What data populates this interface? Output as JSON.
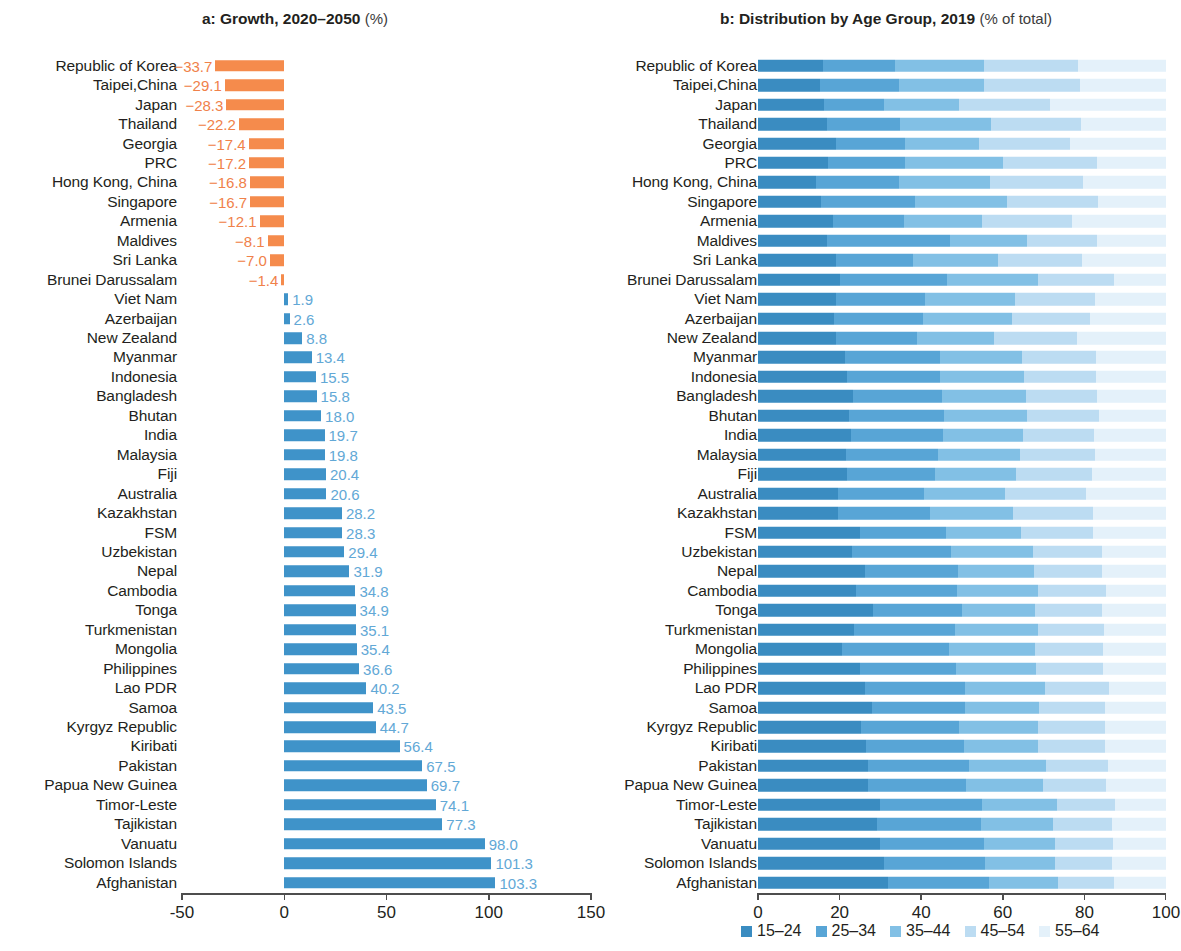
{
  "panels": {
    "a": {
      "title": "a: Growth, 2020–2050",
      "subtitle": "(%)"
    },
    "b": {
      "title": "b: Distribution by Age Group, 2019",
      "subtitle": "(% of total)"
    }
  },
  "colors": {
    "negative_bar": "#f58b4c",
    "positive_bar": "#3f93c9",
    "negative_label": "#f0814a",
    "positive_label": "#62a8d6",
    "age_15_24": "#3a8cc1",
    "age_25_34": "#58a5d6",
    "age_35_44": "#82c0e5",
    "age_45_54": "#bcdcf2",
    "age_55_64": "#e4f1fa"
  },
  "legend": {
    "items": [
      {
        "label": "15–24",
        "color": "#3a8cc1"
      },
      {
        "label": "25–34",
        "color": "#58a5d6"
      },
      {
        "label": "35–44",
        "color": "#82c0e5"
      },
      {
        "label": "45–54",
        "color": "#bcdcf2"
      },
      {
        "label": "55–64",
        "color": "#e4f1fa"
      }
    ]
  },
  "chart_data": [
    {
      "type": "bar",
      "id": "growth",
      "title": "a: Growth, 2020–2050 (%)",
      "xlabel": "",
      "ylabel": "",
      "xlim": [
        -50,
        150
      ],
      "xticks": [
        -50,
        0,
        50,
        100,
        150
      ],
      "xtick_labels": [
        "-50",
        "0",
        "50",
        "100",
        "150"
      ],
      "grid": false,
      "orientation": "horizontal",
      "categories": [
        "Republic of Korea",
        "Taipei,China",
        "Japan",
        "Thailand",
        "Georgia",
        "PRC",
        "Hong Kong, China",
        "Singapore",
        "Armenia",
        "Maldives",
        "Sri Lanka",
        "Brunei Darussalam",
        "Viet Nam",
        "Azerbaijan",
        "New Zealand",
        "Myanmar",
        "Indonesia",
        "Bangladesh",
        "Bhutan",
        "India",
        "Malaysia",
        "Fiji",
        "Australia",
        "Kazakhstan",
        "FSM",
        "Uzbekistan",
        "Nepal",
        "Cambodia",
        "Tonga",
        "Turkmenistan",
        "Mongolia",
        "Philippines",
        "Lao PDR",
        "Samoa",
        "Kyrgyz Republic",
        "Kiribati",
        "Pakistan",
        "Papua New Guinea",
        "Timor-Leste",
        "Tajikistan",
        "Vanuatu",
        "Solomon Islands",
        "Afghanistan"
      ],
      "values": [
        -33.7,
        -29.1,
        -28.3,
        -22.2,
        -17.4,
        -17.2,
        -16.8,
        -16.7,
        -12.1,
        -8.1,
        -7.0,
        -1.4,
        1.9,
        2.6,
        8.8,
        13.4,
        15.5,
        15.8,
        18.0,
        19.7,
        19.8,
        20.4,
        20.6,
        28.2,
        28.3,
        29.4,
        31.9,
        34.8,
        34.9,
        35.1,
        35.4,
        36.6,
        40.2,
        43.5,
        44.7,
        56.4,
        67.5,
        69.7,
        74.1,
        77.3,
        98.0,
        101.3,
        103.3
      ],
      "value_labels": [
        "−33.7",
        "−29.1",
        "−28.3",
        "−22.2",
        "−17.4",
        "−17.2",
        "−16.8",
        "−16.7",
        "−12.1",
        "−8.1",
        "−7.0",
        "−1.4",
        "1.9",
        "2.6",
        "8.8",
        "13.4",
        "15.5",
        "15.8",
        "18.0",
        "19.7",
        "19.8",
        "20.4",
        "20.6",
        "28.2",
        "28.3",
        "29.4",
        "31.9",
        "34.8",
        "34.9",
        "35.1",
        "35.4",
        "36.6",
        "40.2",
        "43.5",
        "44.7",
        "56.4",
        "67.5",
        "69.7",
        "74.1",
        "77.3",
        "98.0",
        "101.3",
        "103.3"
      ]
    },
    {
      "type": "bar",
      "id": "age_distribution",
      "subtype": "stacked-100",
      "title": "b: Distribution by Age Group, 2019 (% of total)",
      "xlabel": "",
      "ylabel": "",
      "xlim": [
        0,
        100
      ],
      "xticks": [
        0,
        20,
        40,
        60,
        80,
        100
      ],
      "xtick_labels": [
        "0",
        "20",
        "40",
        "60",
        "80",
        "100"
      ],
      "grid": false,
      "orientation": "horizontal",
      "legend_position": "bottom",
      "categories": [
        "Republic of Korea",
        "Taipei,China",
        "Japan",
        "Thailand",
        "Georgia",
        "PRC",
        "Hong Kong, China",
        "Singapore",
        "Armenia",
        "Maldives",
        "Sri Lanka",
        "Brunei Darussalam",
        "Viet Nam",
        "Azerbaijan",
        "New Zealand",
        "Myanmar",
        "Indonesia",
        "Bangladesh",
        "Bhutan",
        "India",
        "Malaysia",
        "Fiji",
        "Australia",
        "Kazakhstan",
        "FSM",
        "Uzbekistan",
        "Nepal",
        "Cambodia",
        "Tonga",
        "Turkmenistan",
        "Mongolia",
        "Philippines",
        "Lao PDR",
        "Samoa",
        "Kyrgyz Republic",
        "Kiribati",
        "Pakistan",
        "Papua New Guinea",
        "Timor-Leste",
        "Tajikistan",
        "Vanuatu",
        "Solomon Islands",
        "Afghanistan"
      ],
      "series": [
        {
          "name": "15–24",
          "color": "#3a8cc1",
          "values": [
            15.9,
            15.1,
            16.1,
            16.9,
            19.1,
            17.2,
            14.1,
            15.4,
            18.5,
            16.8,
            19.1,
            20.0,
            19.2,
            18.6,
            19.2,
            21.4,
            21.9,
            23.3,
            22.2,
            22.9,
            21.6,
            21.8,
            19.5,
            19.5,
            25.0,
            23.1,
            26.2,
            24.1,
            28.2,
            23.5,
            20.6,
            25.1,
            26.3,
            28.0,
            25.2,
            26.5,
            27.0,
            27.0,
            29.8,
            29.2,
            30.0,
            30.9,
            31.8
          ]
        },
        {
          "name": "25–34",
          "color": "#58a5d6",
          "values": [
            17.7,
            19.4,
            14.9,
            17.9,
            17.0,
            18.9,
            20.4,
            23.0,
            17.2,
            30.2,
            18.8,
            26.4,
            21.8,
            21.9,
            19.8,
            23.3,
            22.7,
            21.8,
            23.4,
            22.4,
            22.6,
            21.5,
            21.3,
            22.7,
            21.1,
            24.2,
            22.9,
            24.7,
            21.7,
            24.8,
            26.2,
            23.4,
            24.5,
            22.8,
            24.0,
            23.9,
            24.7,
            24.0,
            25.2,
            25.5,
            25.3,
            24.8,
            24.9
          ]
        },
        {
          "name": "35–44",
          "color": "#82c0e5",
          "values": [
            21.8,
            20.8,
            18.3,
            22.2,
            18.1,
            23.9,
            22.3,
            22.6,
            19.3,
            19.0,
            20.9,
            22.3,
            21.9,
            21.8,
            18.9,
            20.0,
            20.5,
            20.6,
            20.4,
            19.7,
            20.1,
            19.9,
            19.8,
            20.4,
            18.4,
            20.1,
            18.5,
            19.9,
            18.1,
            20.3,
            21.2,
            19.6,
            19.5,
            18.0,
            19.4,
            18.3,
            18.8,
            18.9,
            18.2,
            17.7,
            17.4,
            17.0,
            16.8
          ]
        },
        {
          "name": "45–54",
          "color": "#bcdcf2",
          "values": [
            23.0,
            23.6,
            22.2,
            22.2,
            22.3,
            23.1,
            22.8,
            22.3,
            21.9,
            17.2,
            20.7,
            18.5,
            19.8,
            19.2,
            20.2,
            18.1,
            17.8,
            17.3,
            17.7,
            17.4,
            18.3,
            18.6,
            19.9,
            19.5,
            17.7,
            16.8,
            16.7,
            16.5,
            16.3,
            16.2,
            16.5,
            16.5,
            15.7,
            16.3,
            16.4,
            16.3,
            15.4,
            15.4,
            14.4,
            14.4,
            14.2,
            14.1,
            13.7
          ]
        },
        {
          "name": "55–64",
          "color": "#e4f1fa",
          "values": [
            21.6,
            21.1,
            28.5,
            20.8,
            23.5,
            16.9,
            20.4,
            16.7,
            23.1,
            16.8,
            20.5,
            12.8,
            17.3,
            18.5,
            21.9,
            17.2,
            17.1,
            17.0,
            16.3,
            17.6,
            17.4,
            18.2,
            19.5,
            17.9,
            17.8,
            15.8,
            15.7,
            14.8,
            15.7,
            15.2,
            15.5,
            15.4,
            14.0,
            14.9,
            15.0,
            15.0,
            14.1,
            14.7,
            12.4,
            13.2,
            13.1,
            13.2,
            12.8
          ]
        }
      ]
    }
  ]
}
